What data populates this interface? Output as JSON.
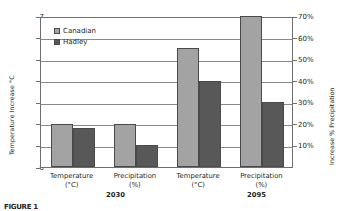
{
  "chart_data": {
    "type": "bar",
    "title": "",
    "xlabel": "",
    "ylabel": "Temperature Increase °C",
    "y2label": "Increase % Precipitation",
    "ylim": [
      0,
      7
    ],
    "y2lim": [
      0,
      70
    ],
    "grid": true,
    "legend_position": "top-left-inside",
    "categories": [
      "Temperature (°C)",
      "Precipitation (%)",
      "Temperature (°C)",
      "Precipitation (%)"
    ],
    "groups": [
      "2030",
      "2030",
      "2095",
      "2095"
    ],
    "series": [
      {
        "name": "Canadian",
        "color": "#a3a3a3",
        "values": [
          2.0,
          2.0,
          5.5,
          7.0
        ]
      },
      {
        "name": "Hadley",
        "color": "#585858",
        "values": [
          1.8,
          1.0,
          4.0,
          3.0
        ]
      }
    ],
    "yticks": [
      "0",
      "1",
      "2",
      "3",
      "4",
      "5",
      "6",
      "7"
    ],
    "y2ticks": [
      "",
      "10%",
      "20%",
      "30%",
      "40%",
      "50%",
      "60%",
      "70%"
    ]
  },
  "axes": {
    "left_title": "Temperature Increase °C",
    "right_title": "Increase % Precipitation"
  },
  "legend": {
    "items": [
      {
        "label": "Canadian",
        "swatch": "legend-swatch-canadian"
      },
      {
        "label": "Hadley",
        "swatch": "legend-swatch-hadley"
      }
    ]
  },
  "xaxis": {
    "categories": [
      {
        "line1": "Temperature",
        "line2": "(°C)"
      },
      {
        "line1": "Precipitation",
        "line2": "(%)"
      },
      {
        "line1": "Temperature",
        "line2": "(°C)"
      },
      {
        "line1": "Precipitation",
        "line2": "(%)"
      }
    ],
    "groups": [
      {
        "label": "2030"
      },
      {
        "label": "2095"
      }
    ]
  },
  "caption": {
    "stub": "FIGURE 1"
  }
}
